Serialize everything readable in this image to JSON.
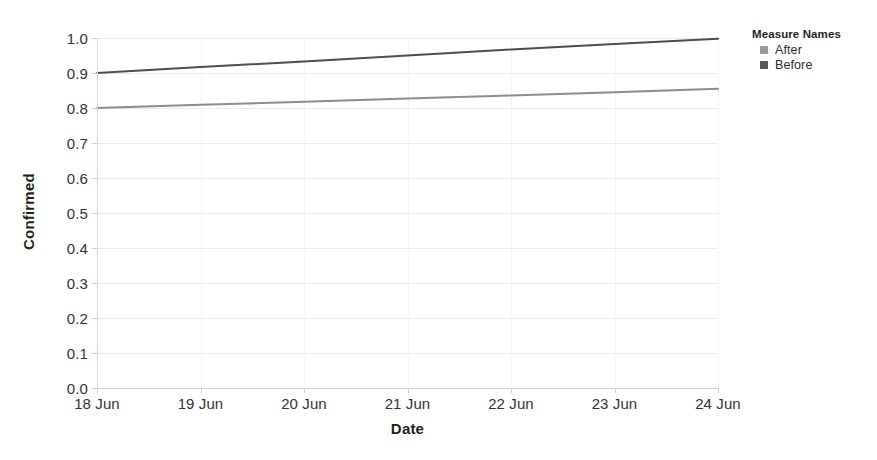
{
  "chart_data": {
    "type": "line",
    "title": "",
    "xlabel": "Date",
    "ylabel": "Confirmed",
    "x": [
      "18 Jun",
      "19 Jun",
      "20 Jun",
      "21 Jun",
      "22 Jun",
      "23 Jun",
      "24 Jun"
    ],
    "xtick_labels": [
      "18 Jun",
      "19 Jun",
      "20 Jun",
      "21 Jun",
      "22 Jun",
      "23 Jun",
      "24 Jun"
    ],
    "ytick_labels": [
      "1.0",
      "0.9",
      "0.8",
      "0.7",
      "0.6",
      "0.5",
      "0.4",
      "0.3",
      "0.2",
      "0.1",
      "0.0"
    ],
    "ytick_values": [
      1.0,
      0.9,
      0.8,
      0.7,
      0.6,
      0.5,
      0.4,
      0.3,
      0.2,
      0.1,
      0.0
    ],
    "ylim": [
      0.0,
      1.0
    ],
    "grid": true,
    "legend_position": "top-right",
    "series": [
      {
        "name": "After",
        "color": "#8d8d8d",
        "values": [
          0.8,
          0.809,
          0.818,
          0.827,
          0.836,
          0.845,
          0.855
        ]
      },
      {
        "name": "Before",
        "color": "#4d4d4d",
        "values": [
          0.9,
          0.917,
          0.933,
          0.95,
          0.967,
          0.983,
          0.998
        ]
      }
    ]
  },
  "legend": {
    "title": "Measure Names",
    "items": [
      {
        "label": "After",
        "color": "#9a9a9a"
      },
      {
        "label": "Before",
        "color": "#585858"
      }
    ]
  },
  "colors": {
    "background": "#ffffff",
    "gridline": "#ebebeb",
    "axis": "#d0d0d0",
    "text": "#2b2b2b",
    "title_text": "#1f1f1f",
    "series_after": "#8d8d8d",
    "series_before": "#4d4d4d"
  }
}
